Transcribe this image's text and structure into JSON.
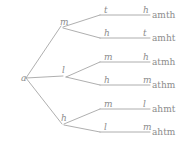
{
  "diagram": {
    "type": "permutation-tree",
    "root": {
      "label": "a",
      "x": 21,
      "y": 74
    },
    "style": {
      "line_color": "#9a9a9a",
      "text_color": "#8c8c8c",
      "background": "#ffffff"
    },
    "level1": [
      {
        "label": "m",
        "x": 60,
        "y": 18
      },
      {
        "label": "l",
        "x": 62,
        "y": 66
      },
      {
        "label": "h",
        "x": 61,
        "y": 114
      }
    ],
    "level2": [
      {
        "label": "t",
        "x": 104,
        "y": 6
      },
      {
        "label": "h",
        "x": 104,
        "y": 29
      },
      {
        "label": "m",
        "x": 104,
        "y": 53
      },
      {
        "label": "h",
        "x": 104,
        "y": 76
      },
      {
        "label": "m",
        "x": 104,
        "y": 100
      },
      {
        "label": "l",
        "x": 104,
        "y": 123
      }
    ],
    "level3": [
      {
        "label": "h",
        "x": 143,
        "y": 6
      },
      {
        "label": "t",
        "x": 143,
        "y": 29
      },
      {
        "label": "h",
        "x": 143,
        "y": 53
      },
      {
        "label": "m",
        "x": 143,
        "y": 76
      },
      {
        "label": "l",
        "x": 143,
        "y": 100
      },
      {
        "label": "m",
        "x": 143,
        "y": 123
      }
    ],
    "leaves": [
      {
        "label": "amth",
        "x": 152,
        "y": 17
      },
      {
        "label": "amht",
        "x": 152,
        "y": 40
      },
      {
        "label": "atmh",
        "x": 152,
        "y": 63
      },
      {
        "label": "athm",
        "x": 152,
        "y": 87
      },
      {
        "label": "ahmt",
        "x": 152,
        "y": 110
      },
      {
        "label": "ahtm",
        "x": 152,
        "y": 134
      }
    ],
    "edges": [
      {
        "name": "root-to-m",
        "d": "M 26 78 L 61 26"
      },
      {
        "name": "root-to-l",
        "d": "M 26 78 L 63 76"
      },
      {
        "name": "root-to-h",
        "d": "M 26 78 L 62 124"
      },
      {
        "name": "m-to-t",
        "d": "M 63 27 L 100 15"
      },
      {
        "name": "t-to-amth",
        "d": "M 100 15 L 150 15"
      },
      {
        "name": "m-to-h",
        "d": "M 63 28 L 100 38"
      },
      {
        "name": "h-to-amht",
        "d": "M 100 38 L 150 38"
      },
      {
        "name": "l-to-m",
        "d": "M 66 77 L 100 62"
      },
      {
        "name": "m-to-atmh",
        "d": "M 100 62 L 150 62"
      },
      {
        "name": "l-to-h",
        "d": "M 66 77 L 100 85"
      },
      {
        "name": "h-to-athm",
        "d": "M 100 85 L 150 85"
      },
      {
        "name": "h-to-m",
        "d": "M 64 124 L 100 109"
      },
      {
        "name": "m-to-ahmt",
        "d": "M 100 109 L 150 109"
      },
      {
        "name": "h-to-l",
        "d": "M 64 125 L 100 132"
      },
      {
        "name": "l-to-ahtm",
        "d": "M 100 132 L 150 132"
      }
    ]
  }
}
